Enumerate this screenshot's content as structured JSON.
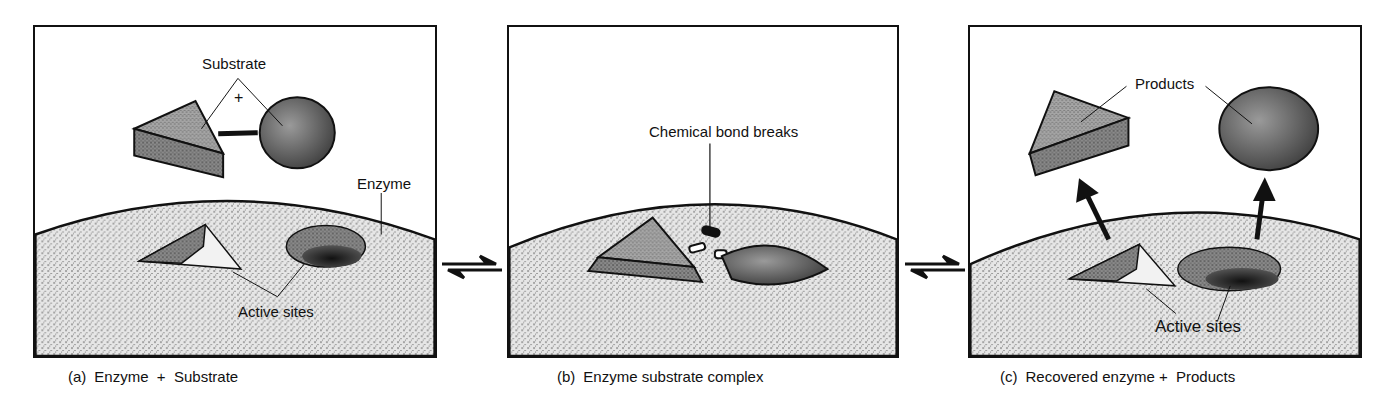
{
  "figure": {
    "panels": [
      {
        "id": "a",
        "caption_tag": "(a)",
        "caption_text": "Enzyme  +  Substrate",
        "labels": {
          "substrate": "Substrate",
          "plus": "+",
          "enzyme": "Enzyme",
          "active_sites": "Active sites"
        }
      },
      {
        "id": "b",
        "caption_tag": "(b)",
        "caption_text": "Enzyme substrate complex",
        "labels": {
          "bond_break": "Chemical bond breaks"
        }
      },
      {
        "id": "c",
        "caption_tag": "(c)",
        "caption_text": "Recovered enzyme +  Products",
        "labels": {
          "products": "Products",
          "active_sites": "Active sites"
        }
      }
    ],
    "arrows": [
      {
        "between": [
          "a",
          "b"
        ],
        "type": "equilibrium-arrow"
      },
      {
        "between": [
          "b",
          "c"
        ],
        "type": "equilibrium-arrow"
      }
    ],
    "colors": {
      "ink": "#111111",
      "enzyme_fill": "#d9d9d9",
      "substrate_fill": "#8c8c8c",
      "shadow_fill": "#2a2a2a",
      "background": "#ffffff"
    }
  }
}
